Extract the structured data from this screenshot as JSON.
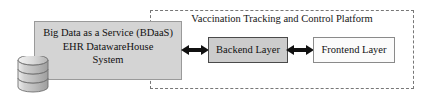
{
  "diagram": {
    "platform": {
      "label": "Vaccination Tracking and Control Platform",
      "border_style": "dashed",
      "border_color": "#777777"
    },
    "bdaas": {
      "line1": "Big Data as a Service (BDaaS)",
      "line2": "EHR DatawareHouse",
      "line3": "System",
      "fill_color": "#d4d4d4",
      "border_color": "#9a9a9a"
    },
    "database": {
      "icon": "database-cylinder-icon",
      "disc_count": 3,
      "fill_color": "#c9c9c9"
    },
    "backend": {
      "label": "Backend Layer",
      "fill_color": "#cccccc",
      "border_color": "#4a4a4a"
    },
    "frontend": {
      "label": "Frontend Layer",
      "fill_color": "#fbfbfb",
      "border_color": "#8a8a8a"
    },
    "connectors": [
      {
        "name": "bdaas-to-backend",
        "type": "double-headed-arrow",
        "from": "Big Data as a Service (BDaaS) EHR DatawareHouse System",
        "to": "Backend Layer",
        "color": "#111111"
      },
      {
        "name": "backend-to-frontend",
        "type": "double-headed-arrow",
        "from": "Backend Layer",
        "to": "Frontend Layer",
        "color": "#111111"
      }
    ]
  }
}
